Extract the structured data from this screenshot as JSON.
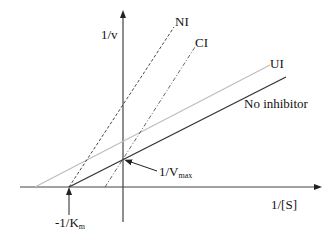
{
  "axes": {
    "y_label": "1/v",
    "x_label": "1/[S]"
  },
  "lines": {
    "noncompetitive": {
      "label": "NI",
      "style": "dashed",
      "color": "#333333"
    },
    "competitive": {
      "label": "CI",
      "style": "dash-dot",
      "color": "#555555"
    },
    "uncompetitive": {
      "label": "UI",
      "style": "solid",
      "color": "#b8b8b8"
    },
    "no_inhibitor": {
      "label": "No inhibitor",
      "style": "solid",
      "color": "#333333"
    }
  },
  "annotations": {
    "vmax": {
      "main": "1/V",
      "sub": "max"
    },
    "km": {
      "main": "-1/K",
      "sub": "m"
    }
  }
}
